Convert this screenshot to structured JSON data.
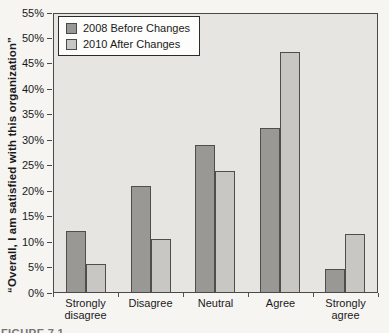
{
  "figure": {
    "partial_caption": "FIGURE 7.1",
    "colors": {
      "page_bg": "#f6f5f2",
      "plot_bg": "#e6e5e1",
      "axis": "#4a4a4a",
      "text": "#1a1a1a",
      "legend_bg": "#fdfdfb",
      "legend_border": "#2a2a2a"
    }
  },
  "chart_data": {
    "type": "bar",
    "title": "",
    "xlabel": "",
    "ylabel": "“Overall, I am satisfied with this organization”",
    "categories": [
      "Strongly disagree",
      "Disagree",
      "Neutral",
      "Agree",
      "Strongly agree"
    ],
    "series": [
      {
        "name": "2008 Before Changes",
        "color": "#999894",
        "values": [
          12,
          21,
          29,
          32.5,
          4.5
        ]
      },
      {
        "name": "2010 After Changes",
        "color": "#c8c7c3",
        "values": [
          5.5,
          10.5,
          24,
          47.5,
          11.5
        ]
      }
    ],
    "ylim": [
      0,
      55
    ],
    "y_tick_step": 5,
    "y_tick_labels": [
      "0%",
      "5%",
      "10%",
      "15%",
      "20%",
      "25%",
      "30%",
      "35%",
      "40%",
      "45%",
      "50%",
      "55%"
    ],
    "grid": false,
    "legend_position": "top-left"
  }
}
